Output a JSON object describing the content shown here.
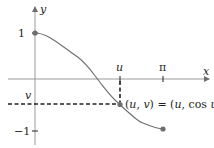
{
  "figure": {
    "colors": {
      "axis": "#9a9a9a",
      "curve": "#6d6e71",
      "dash": "#231f20",
      "point": "#6d6e71",
      "text": "#231f20"
    },
    "axes": {
      "x_label": "x",
      "y_label": "y"
    },
    "ticks": {
      "x": [
        {
          "label": "u",
          "value": "u"
        },
        {
          "label": "π",
          "value": 3.14159
        }
      ],
      "y": [
        {
          "label": "1",
          "value": 1
        },
        {
          "label": "v",
          "value": "v"
        },
        {
          "label": "−1",
          "value": -1
        }
      ]
    },
    "curve": {
      "function": "cos x",
      "domain": [
        0,
        3.14159
      ],
      "start_point": [
        0,
        1
      ],
      "end_point": [
        3.14159,
        -1
      ]
    },
    "marked_point": {
      "label": "(u, v) = (u, cos u)",
      "u_approx": 2.09,
      "v_approx": -0.5
    }
  }
}
